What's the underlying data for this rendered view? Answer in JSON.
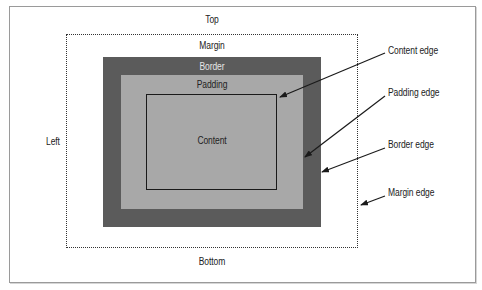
{
  "diagram": {
    "type": "css-box-model",
    "regions": {
      "top": "Top",
      "left": "Left",
      "bottom": "Bottom",
      "margin": "Margin",
      "border": "Border",
      "padding": "Padding",
      "content": "Content"
    },
    "edge_labels": {
      "content_edge": "Content edge",
      "padding_edge": "Padding edge",
      "border_edge": "Border edge",
      "margin_edge": "Margin edge"
    },
    "colors": {
      "border_fill": "#5b5b5b",
      "padding_fill": "#a8a8a8",
      "content_outline": "#1a1a1a",
      "margin_outline": "#333333",
      "background": "#ffffff"
    }
  }
}
